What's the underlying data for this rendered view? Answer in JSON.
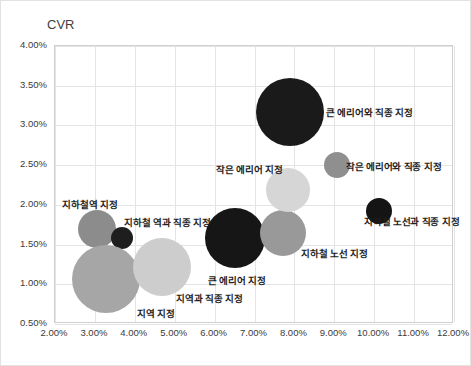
{
  "chart_data": {
    "type": "scatter",
    "title": "",
    "xlabel": "CTR",
    "ylabel": "CVR",
    "xlim": [
      2.0,
      12.0
    ],
    "ylim": [
      0.5,
      4.0
    ],
    "grid": true,
    "legend": "none",
    "xticks": [
      "2.00%",
      "3.00%",
      "4.00%",
      "5.00%",
      "6.00%",
      "7.00%",
      "8.00%",
      "9.00%",
      "10.00%",
      "11.00%",
      "12.00%"
    ],
    "yticks": [
      "0.50%",
      "1.00%",
      "1.50%",
      "2.00%",
      "2.50%",
      "3.00%",
      "3.50%",
      "4.00%"
    ],
    "points": [
      {
        "label": "지하철역 지정",
        "x": 3.05,
        "y": 1.69,
        "size": 19,
        "color": "#8c8c8c",
        "label_x": 89,
        "label_y": 196,
        "label_align": "center"
      },
      {
        "label": "지하철 역과 직종 지정",
        "x": 3.68,
        "y": 1.58,
        "size": 11,
        "color": "#1e1e1e",
        "label_x": 123,
        "label_y": 214,
        "label_align": "left"
      },
      {
        "label": "지역 지정",
        "x": 3.28,
        "y": 1.07,
        "size": 34,
        "color": "#a6a6a6",
        "label_x": 136,
        "label_y": 305,
        "label_align": "left"
      },
      {
        "label": "지역과 직종 지정",
        "x": 4.68,
        "y": 1.22,
        "size": 29,
        "color": "#cdcdcd",
        "label_x": 175,
        "label_y": 290,
        "label_align": "left"
      },
      {
        "label": "큰 에리어 지정",
        "x": 6.52,
        "y": 1.58,
        "size": 30,
        "color": "#161616",
        "label_x": 207,
        "label_y": 272,
        "label_align": "left"
      },
      {
        "label": "지하철 노선 지정",
        "x": 7.72,
        "y": 1.64,
        "size": 23,
        "color": "#999999",
        "label_x": 300,
        "label_y": 245,
        "label_align": "left"
      },
      {
        "label": "작은 에리어 지정",
        "x": 7.85,
        "y": 2.19,
        "size": 22,
        "color": "#d6d6d6",
        "label_x": 215,
        "label_y": 161,
        "label_align": "left"
      },
      {
        "label": "작은 에리어와 직종 지정",
        "x": 9.08,
        "y": 2.5,
        "size": 13,
        "color": "#8f8f8f",
        "label_x": 345,
        "label_y": 158,
        "label_align": "left"
      },
      {
        "label": "큰 에리어와 직종 지정",
        "x": 7.9,
        "y": 3.17,
        "size": 34,
        "color": "#1a1a1a",
        "label_x": 325,
        "label_y": 104,
        "label_align": "left"
      },
      {
        "label": "지하철 노선과 직종 지정",
        "x": 10.12,
        "y": 1.92,
        "size": 13,
        "color": "#141414",
        "label_x": 363,
        "label_y": 213,
        "label_align": "left"
      }
    ]
  }
}
